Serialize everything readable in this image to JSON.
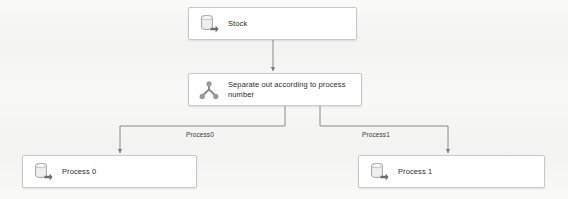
{
  "diagram": {
    "background_color": "#f4f4f2",
    "node_fill": "#ffffff",
    "node_border": "#c8c8c8",
    "connector_color": "#8a8a8a",
    "nodes": [
      {
        "id": "stock",
        "label": "Stock",
        "icon": "database-icon"
      },
      {
        "id": "separate",
        "label": "Separate out according to process\nnumber",
        "icon": "split-fork-icon"
      },
      {
        "id": "process0",
        "label": "Process 0",
        "icon": "database-icon"
      },
      {
        "id": "process1",
        "label": "Process 1",
        "icon": "database-icon"
      }
    ],
    "edges": [
      {
        "id": "edge-stock-separate",
        "from": "stock",
        "to": "separate",
        "label": ""
      },
      {
        "id": "edge-separate-process0",
        "from": "separate",
        "to": "process0",
        "label": "Process0"
      },
      {
        "id": "edge-separate-process1",
        "from": "separate",
        "to": "process1",
        "label": "Process1"
      }
    ]
  }
}
